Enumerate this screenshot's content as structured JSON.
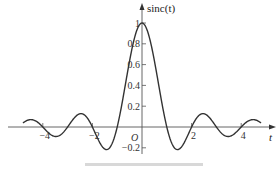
{
  "chart_data": {
    "type": "line",
    "title": "",
    "function": "sinc(t) = sin(pi t)/(pi t)",
    "xlabel": "t",
    "ylabel": "sinc(t)",
    "origin_label": "O",
    "x_ticks": [
      -4,
      -2,
      2,
      4
    ],
    "x_tick_labels": [
      "-4",
      "-2",
      "2",
      "4"
    ],
    "y_ticks": [
      -0.2,
      0.2,
      0.4,
      0.6,
      0.8,
      1
    ],
    "y_tick_labels": [
      "-0.2",
      "0.2",
      "0.4",
      "0.6",
      "0.8",
      "1"
    ],
    "xlim": [
      -4.8,
      4.8
    ],
    "ylim": [
      -0.25,
      1.05
    ],
    "grid": false,
    "legend": null,
    "series": [
      {
        "name": "sinc(t)",
        "x": [
          -4.8,
          -4.5,
          -4,
          -3.5,
          -3,
          -2.5,
          -2,
          -1.5,
          -1,
          -0.5,
          0,
          0.5,
          1,
          1.5,
          2,
          2.5,
          3,
          3.5,
          4,
          4.5,
          4.8
        ],
        "values": [
          -0.039,
          0.071,
          0,
          -0.091,
          0,
          0.127,
          0,
          -0.212,
          0,
          0.637,
          1,
          0.637,
          0,
          -0.212,
          0,
          0.127,
          0,
          -0.091,
          0,
          0.071,
          -0.039
        ]
      }
    ],
    "annotations": []
  },
  "colors": {
    "curve": "#333333",
    "axis": "#555555",
    "text": "#333333"
  }
}
